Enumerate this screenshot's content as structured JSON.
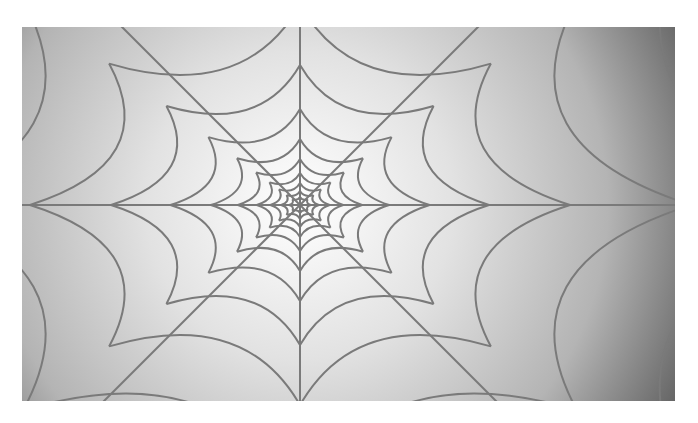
{
  "image": {
    "subject": "spider web",
    "description": "Grayscale spider web illustration on a radial gradient background",
    "colors": {
      "page_background": "#ffffff",
      "gradient_center": "#ffffff",
      "gradient_mid": "#c8c8c8",
      "gradient_edge": "#5e5e5e",
      "thread": "#7a7a7a"
    },
    "web": {
      "spokes": 8,
      "rings": 9
    }
  }
}
